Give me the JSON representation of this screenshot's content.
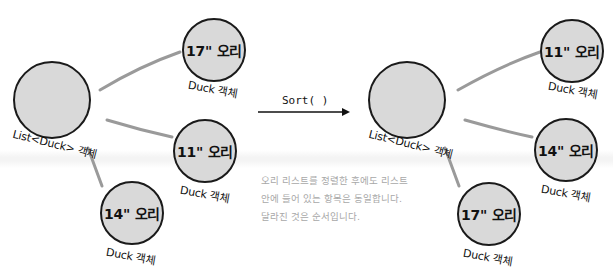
{
  "diagram": {
    "before": {
      "list_label": "List<Duck> 객체",
      "ducks": [
        {
          "title": "17\" 오리",
          "caption": "Duck 객체"
        },
        {
          "title": "11\" 오리",
          "caption": "Duck 객체"
        },
        {
          "title": "14\" 오리",
          "caption": "Duck 객체"
        }
      ]
    },
    "operation": {
      "label": "Sort( )"
    },
    "after": {
      "list_label": "List<Duck> 객체",
      "ducks": [
        {
          "title": "11\" 오리",
          "caption": "Duck 객체"
        },
        {
          "title": "14\" 오리",
          "caption": "Duck 객체"
        },
        {
          "title": "17\" 오리",
          "caption": "Duck 객체"
        }
      ]
    },
    "note": {
      "lines": [
        "오리 리스트를 정렬한 후에도 리스트",
        "안에 들어 있는 항목은 동일합니다.",
        "달라진 것은 순서입니다."
      ]
    },
    "colors": {
      "circle_fill": "#d9d9d9",
      "circle_stroke": "#1a1a1a",
      "connector": "#9a9a9a",
      "note_text": "#a8a8a8"
    }
  }
}
